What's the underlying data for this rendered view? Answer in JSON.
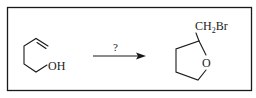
{
  "diagram": {
    "type": "chemical-reaction",
    "reactant": {
      "name": "4-penten-1-ol",
      "labels": {
        "hydroxyl": "OH"
      }
    },
    "arrow": {
      "reagent_label": "?"
    },
    "product": {
      "name": "2-(bromomethyl)tetrahydrofuran",
      "labels": {
        "substituent_main": "CH",
        "substituent_sub": "2",
        "substituent_tail": "Br",
        "ring_oxygen": "O"
      }
    },
    "colors": {
      "stroke": "#1a1a1a",
      "background": "#ffffff"
    }
  }
}
